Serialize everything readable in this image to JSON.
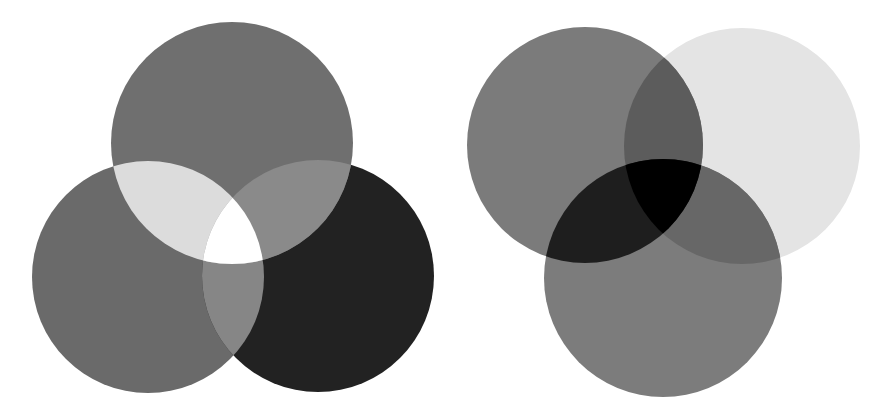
{
  "diagrams": [
    {
      "id": "additive",
      "description": "Three overlapping circles, additive (light) mixing: overlaps get lighter, center is white",
      "circles": [
        {
          "name": "top-circle",
          "cx": 232,
          "cy": 143,
          "r": 121,
          "fill": "#6f6f6f"
        },
        {
          "name": "left-circle",
          "cx": 148,
          "cy": 277,
          "r": 116,
          "fill": "#6a6a6a"
        },
        {
          "name": "right-circle",
          "cx": 318,
          "cy": 276,
          "r": 116,
          "fill": "#222222"
        }
      ],
      "regions": {
        "top_left": "#dcdcdc",
        "top_right": "#8a8a8a",
        "left_right": "#868686",
        "center": "#ffffff"
      }
    },
    {
      "id": "subtractive",
      "description": "Three overlapping circles, subtractive (pigment) mixing: overlaps get darker, center is black",
      "circles": [
        {
          "name": "left-circle",
          "cx": 585,
          "cy": 145,
          "r": 118,
          "fill": "#7b7b7b"
        },
        {
          "name": "right-circle",
          "cx": 742,
          "cy": 146,
          "r": 118,
          "fill": "#e4e4e4"
        },
        {
          "name": "bottom-circle",
          "cx": 663,
          "cy": 278,
          "r": 119,
          "fill": "#7c7c7c"
        }
      ],
      "regions": {
        "left_right": "#5c5c5c",
        "left_bottom": "#1e1e1e",
        "right_bottom": "#676767",
        "center": "#000000"
      }
    }
  ]
}
